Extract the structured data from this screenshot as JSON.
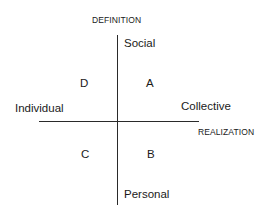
{
  "diagram": {
    "vertical_axis": {
      "title": "DEFINITION",
      "top_pole": "Social",
      "bottom_pole": "Personal"
    },
    "horizontal_axis": {
      "title": "REALIZATION",
      "left_pole": "Individual",
      "right_pole": "Collective"
    },
    "quadrants": {
      "top_left": "D",
      "top_right": "A",
      "bottom_left": "C",
      "bottom_right": "B"
    },
    "colors": {
      "line": "#2a2a2a",
      "text": "#1a1a1a",
      "background": "#ffffff"
    }
  }
}
